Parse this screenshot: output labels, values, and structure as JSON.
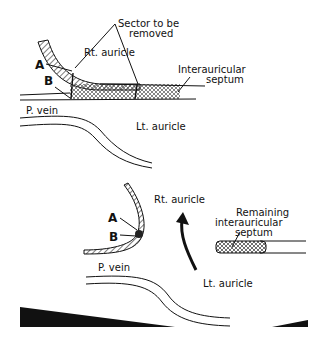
{
  "figure": {
    "top_panel": {
      "labels": {
        "sector": "Sector to be",
        "sector_2": "removed",
        "rt_auricle": "Rt. auricle",
        "a": "A",
        "b": "B",
        "septum_1": "Interauricular",
        "septum_2": "septum",
        "p_vein": "P. vein",
        "lt_auricle": "Lt. auricle"
      }
    },
    "bottom_panel": {
      "labels": {
        "rt_auricle": "Rt. auricle",
        "a": "A",
        "b": "B",
        "remaining_1": "Remaining",
        "remaining_2": "interauricular",
        "remaining_3": "septum",
        "p_vein": "P. vein",
        "lt_auricle": "Lt. auricle"
      }
    }
  }
}
